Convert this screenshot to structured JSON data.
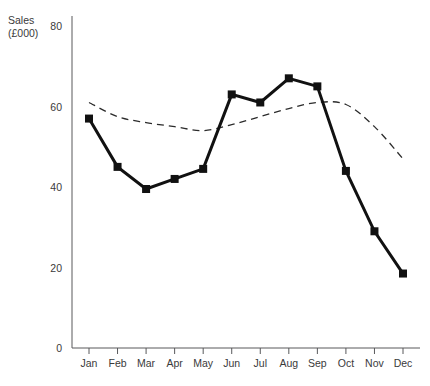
{
  "chart_data": {
    "type": "line",
    "title": "",
    "subtitle": "",
    "xlabel": "",
    "ylabel": "Sales\n(£000)",
    "ylabel_lines": [
      "Sales",
      "(£000)"
    ],
    "categories": [
      "Jan",
      "Feb",
      "Mar",
      "Apr",
      "May",
      "Jun",
      "Jul",
      "Aug",
      "Sep",
      "Oct",
      "Nov",
      "Dec"
    ],
    "ylim": [
      0,
      80
    ],
    "yticks": [
      0,
      20,
      40,
      60,
      80
    ],
    "ytick_labels": [
      "0",
      "20",
      "40",
      "60",
      "80"
    ],
    "grid": false,
    "legend": "none",
    "series": [
      {
        "name": "Sales",
        "style": "solid-with-square-markers",
        "color": "#111111",
        "values": [
          57,
          45,
          39.5,
          42,
          44.5,
          63,
          61,
          67,
          65,
          44,
          29,
          18.5
        ]
      },
      {
        "name": "Trend",
        "style": "dashed",
        "color": "#2b2b2b",
        "values": [
          61,
          57.5,
          56,
          55,
          54,
          55.5,
          57.5,
          59.5,
          61,
          60.5,
          55,
          47
        ]
      }
    ]
  },
  "axis": {
    "y_top_label": "80"
  }
}
